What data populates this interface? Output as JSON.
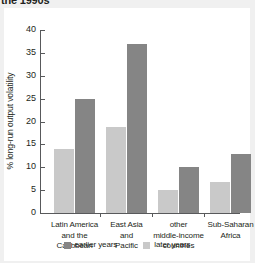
{
  "figure": {
    "title": "the 1990s"
  },
  "legend": {
    "position": "bottom-center",
    "items": [
      {
        "label": "earlier years",
        "color": "#858585",
        "key": "earlier"
      },
      {
        "label": "later years",
        "color": "#c9c9c9",
        "key": "later"
      }
    ]
  },
  "chart_data": {
    "type": "bar",
    "title": "the 1990s",
    "xlabel": "",
    "ylabel": "% long-run output volatility",
    "ylim": [
      0,
      40
    ],
    "yticks": [
      0,
      5,
      10,
      15,
      20,
      25,
      30,
      35,
      40
    ],
    "ytick_labels": [
      "0",
      "5",
      "10",
      "15",
      "20",
      "25",
      "30",
      "35",
      "40"
    ],
    "grid": false,
    "legend_position": "bottom-center",
    "categories": [
      "Latin America and the Caribbean",
      "East Asia and Pacific",
      "other middle-income countries",
      "Sub-Saharan Africa"
    ],
    "category_lines": [
      [
        "Latin America",
        "and the",
        "Caribbean"
      ],
      [
        "East Asia",
        "and",
        "Pacific"
      ],
      [
        "other",
        "middle-income",
        "countries"
      ],
      [
        "Sub-Saharan",
        "Africa"
      ]
    ],
    "series": [
      {
        "name": "later years",
        "color": "#c9c9c9",
        "values": [
          14.0,
          18.7,
          5.0,
          6.8
        ]
      },
      {
        "name": "earlier years",
        "color": "#858585",
        "values": [
          25.0,
          37.0,
          10.0,
          13.0
        ]
      }
    ]
  }
}
